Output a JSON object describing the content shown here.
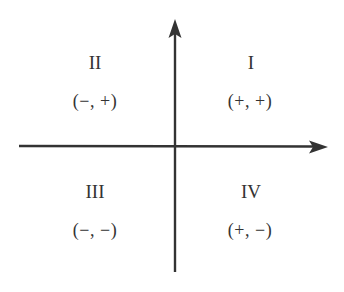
{
  "diagram": {
    "type": "cartesian-quadrants",
    "colors": {
      "axis": "#333333",
      "text": "#333333",
      "background": "#ffffff"
    },
    "axes": {
      "x_axis": {
        "direction": "right",
        "has_arrow": true
      },
      "y_axis": {
        "direction": "up",
        "has_arrow": true
      }
    },
    "quadrants": [
      {
        "id": "I",
        "numeral": "I",
        "signs": "(+,  +)",
        "position": "top-right"
      },
      {
        "id": "II",
        "numeral": "II",
        "signs": "(−,  +)",
        "position": "top-left"
      },
      {
        "id": "III",
        "numeral": "III",
        "signs": "(−,  −)",
        "position": "bottom-left"
      },
      {
        "id": "IV",
        "numeral": "IV",
        "signs": "(+,  −)",
        "position": "bottom-right"
      }
    ]
  }
}
